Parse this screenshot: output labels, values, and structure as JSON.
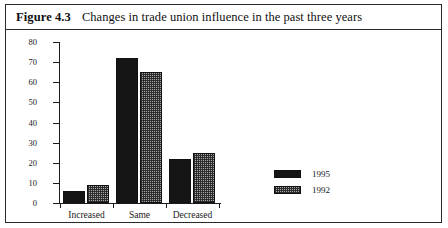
{
  "figure": {
    "number_label": "Figure 4.3",
    "caption": "Changes in trade union influence in the past three years"
  },
  "colors": {
    "series_1995": "#151515",
    "series_1992": "#a8a8a8",
    "axis": "#1c1c1c",
    "border": "#2a2a2a",
    "text": "#1a1a1a"
  },
  "axis": {
    "y_tick_labels": [
      "80",
      "70",
      "60",
      "50",
      "40",
      "30",
      "20",
      "10",
      "0"
    ],
    "x_category_labels": [
      "Increased",
      "Same",
      "Decreased"
    ]
  },
  "legend": {
    "entries": [
      {
        "label": "1995",
        "pattern": "solid-black"
      },
      {
        "label": "1992",
        "pattern": "checkered-gray"
      }
    ]
  },
  "chart_data": {
    "type": "bar",
    "title": "Changes in trade union influence in the past three years",
    "xlabel": "",
    "ylabel": "",
    "ylim": [
      0,
      80
    ],
    "ytick_step": 10,
    "grid": false,
    "legend_position": "right-inside",
    "categories": [
      "Increased",
      "Same",
      "Decreased"
    ],
    "series": [
      {
        "name": "1995",
        "values": [
          6,
          72,
          22
        ]
      },
      {
        "name": "1992",
        "values": [
          9,
          65,
          25
        ]
      }
    ]
  }
}
